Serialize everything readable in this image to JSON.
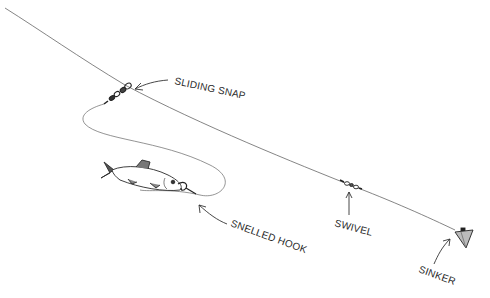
{
  "diagram": {
    "type": "fishing rig illustration",
    "labels": {
      "sliding_snap": "SLIDING SNAP",
      "snelled_hook": "SNELLED HOOK",
      "swivel": "SWIVEL",
      "sinker": "SINKER"
    },
    "components": [
      "main-line",
      "sliding-snap",
      "leader",
      "baitfish",
      "snelled-hook",
      "swivel",
      "sinker"
    ],
    "colors": {
      "line": "#555555",
      "ink": "#2a2a2a",
      "background": "#ffffff"
    }
  }
}
